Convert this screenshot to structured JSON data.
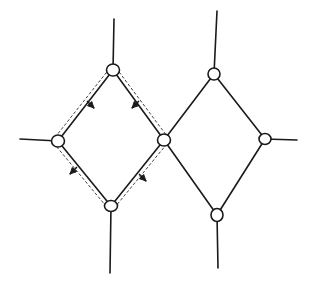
{
  "diagram": {
    "colors": {
      "stroke": "#1a1a1a",
      "background": "#ffffff"
    },
    "nodes": [
      {
        "id": "L-top",
        "x": 113,
        "y": 70,
        "rx": 6.5,
        "ry": 6
      },
      {
        "id": "L-left",
        "x": 58,
        "y": 141,
        "rx": 6.5,
        "ry": 6
      },
      {
        "id": "center",
        "x": 164,
        "y": 140,
        "rx": 6.5,
        "ry": 6
      },
      {
        "id": "L-bottom",
        "x": 111,
        "y": 206,
        "rx": 6.5,
        "ry": 5.5
      },
      {
        "id": "R-top",
        "x": 214,
        "y": 74,
        "rx": 6,
        "ry": 6
      },
      {
        "id": "R-right",
        "x": 265,
        "y": 139,
        "rx": 6,
        "ry": 5.5
      },
      {
        "id": "R-bottom",
        "x": 217,
        "y": 215,
        "rx": 6,
        "ry": 6.5
      }
    ],
    "edges": [
      {
        "from": "L-top",
        "to": "L-left"
      },
      {
        "from": "L-top",
        "to": "center"
      },
      {
        "from": "L-left",
        "to": "L-bottom"
      },
      {
        "from": "center",
        "to": "L-bottom"
      },
      {
        "from": "R-top",
        "to": "center"
      },
      {
        "from": "R-top",
        "to": "R-right"
      },
      {
        "from": "center",
        "to": "R-bottom"
      },
      {
        "from": "R-right",
        "to": "R-bottom"
      }
    ],
    "stubs": [
      {
        "node": "L-top",
        "x2": 114,
        "y2": 19
      },
      {
        "node": "L-left",
        "x2": 20,
        "y2": 139
      },
      {
        "node": "L-bottom",
        "x2": 110,
        "y2": 273
      },
      {
        "node": "R-top",
        "x2": 217,
        "y2": 11
      },
      {
        "node": "R-right",
        "x2": 297,
        "y2": 140
      },
      {
        "node": "R-bottom",
        "x2": 218,
        "y2": 268
      }
    ],
    "dashed_loop": {
      "around": [
        "L-top",
        "center",
        "L-bottom",
        "L-left"
      ],
      "arrows": [
        {
          "edge": "L-top→L-left",
          "x": 91,
          "y": 105,
          "direction": "down-right"
        },
        {
          "edge": "L-top→center",
          "x": 135,
          "y": 105,
          "direction": "down-left"
        },
        {
          "edge": "L-left→L-bottom",
          "x": 73,
          "y": 171,
          "direction": "down-left"
        },
        {
          "edge": "center→L-bottom",
          "x": 143,
          "y": 178,
          "direction": "down-right"
        }
      ]
    }
  }
}
